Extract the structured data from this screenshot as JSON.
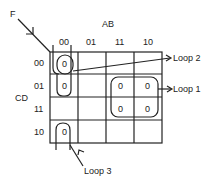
{
  "diagram": {
    "type": "karnaugh-map",
    "function_label": "F",
    "column_variable": "AB",
    "row_variable": "CD",
    "column_headers": [
      "00",
      "01",
      "11",
      "10"
    ],
    "row_headers": [
      "00",
      "01",
      "11",
      "10"
    ],
    "cells": [
      [
        "0",
        "",
        "",
        ""
      ],
      [
        "0",
        "",
        "0",
        "0"
      ],
      [
        "",
        "",
        "0",
        "0"
      ],
      [
        "0",
        "",
        "",
        ""
      ]
    ],
    "loops": [
      {
        "label": "Loop 1",
        "cells": "rows 01-11, cols 11-10"
      },
      {
        "label": "Loop 2",
        "cells": "row 00, col 00"
      },
      {
        "label": "Loop 3",
        "cells": "rows 10-00 wrap, col 00"
      }
    ]
  }
}
